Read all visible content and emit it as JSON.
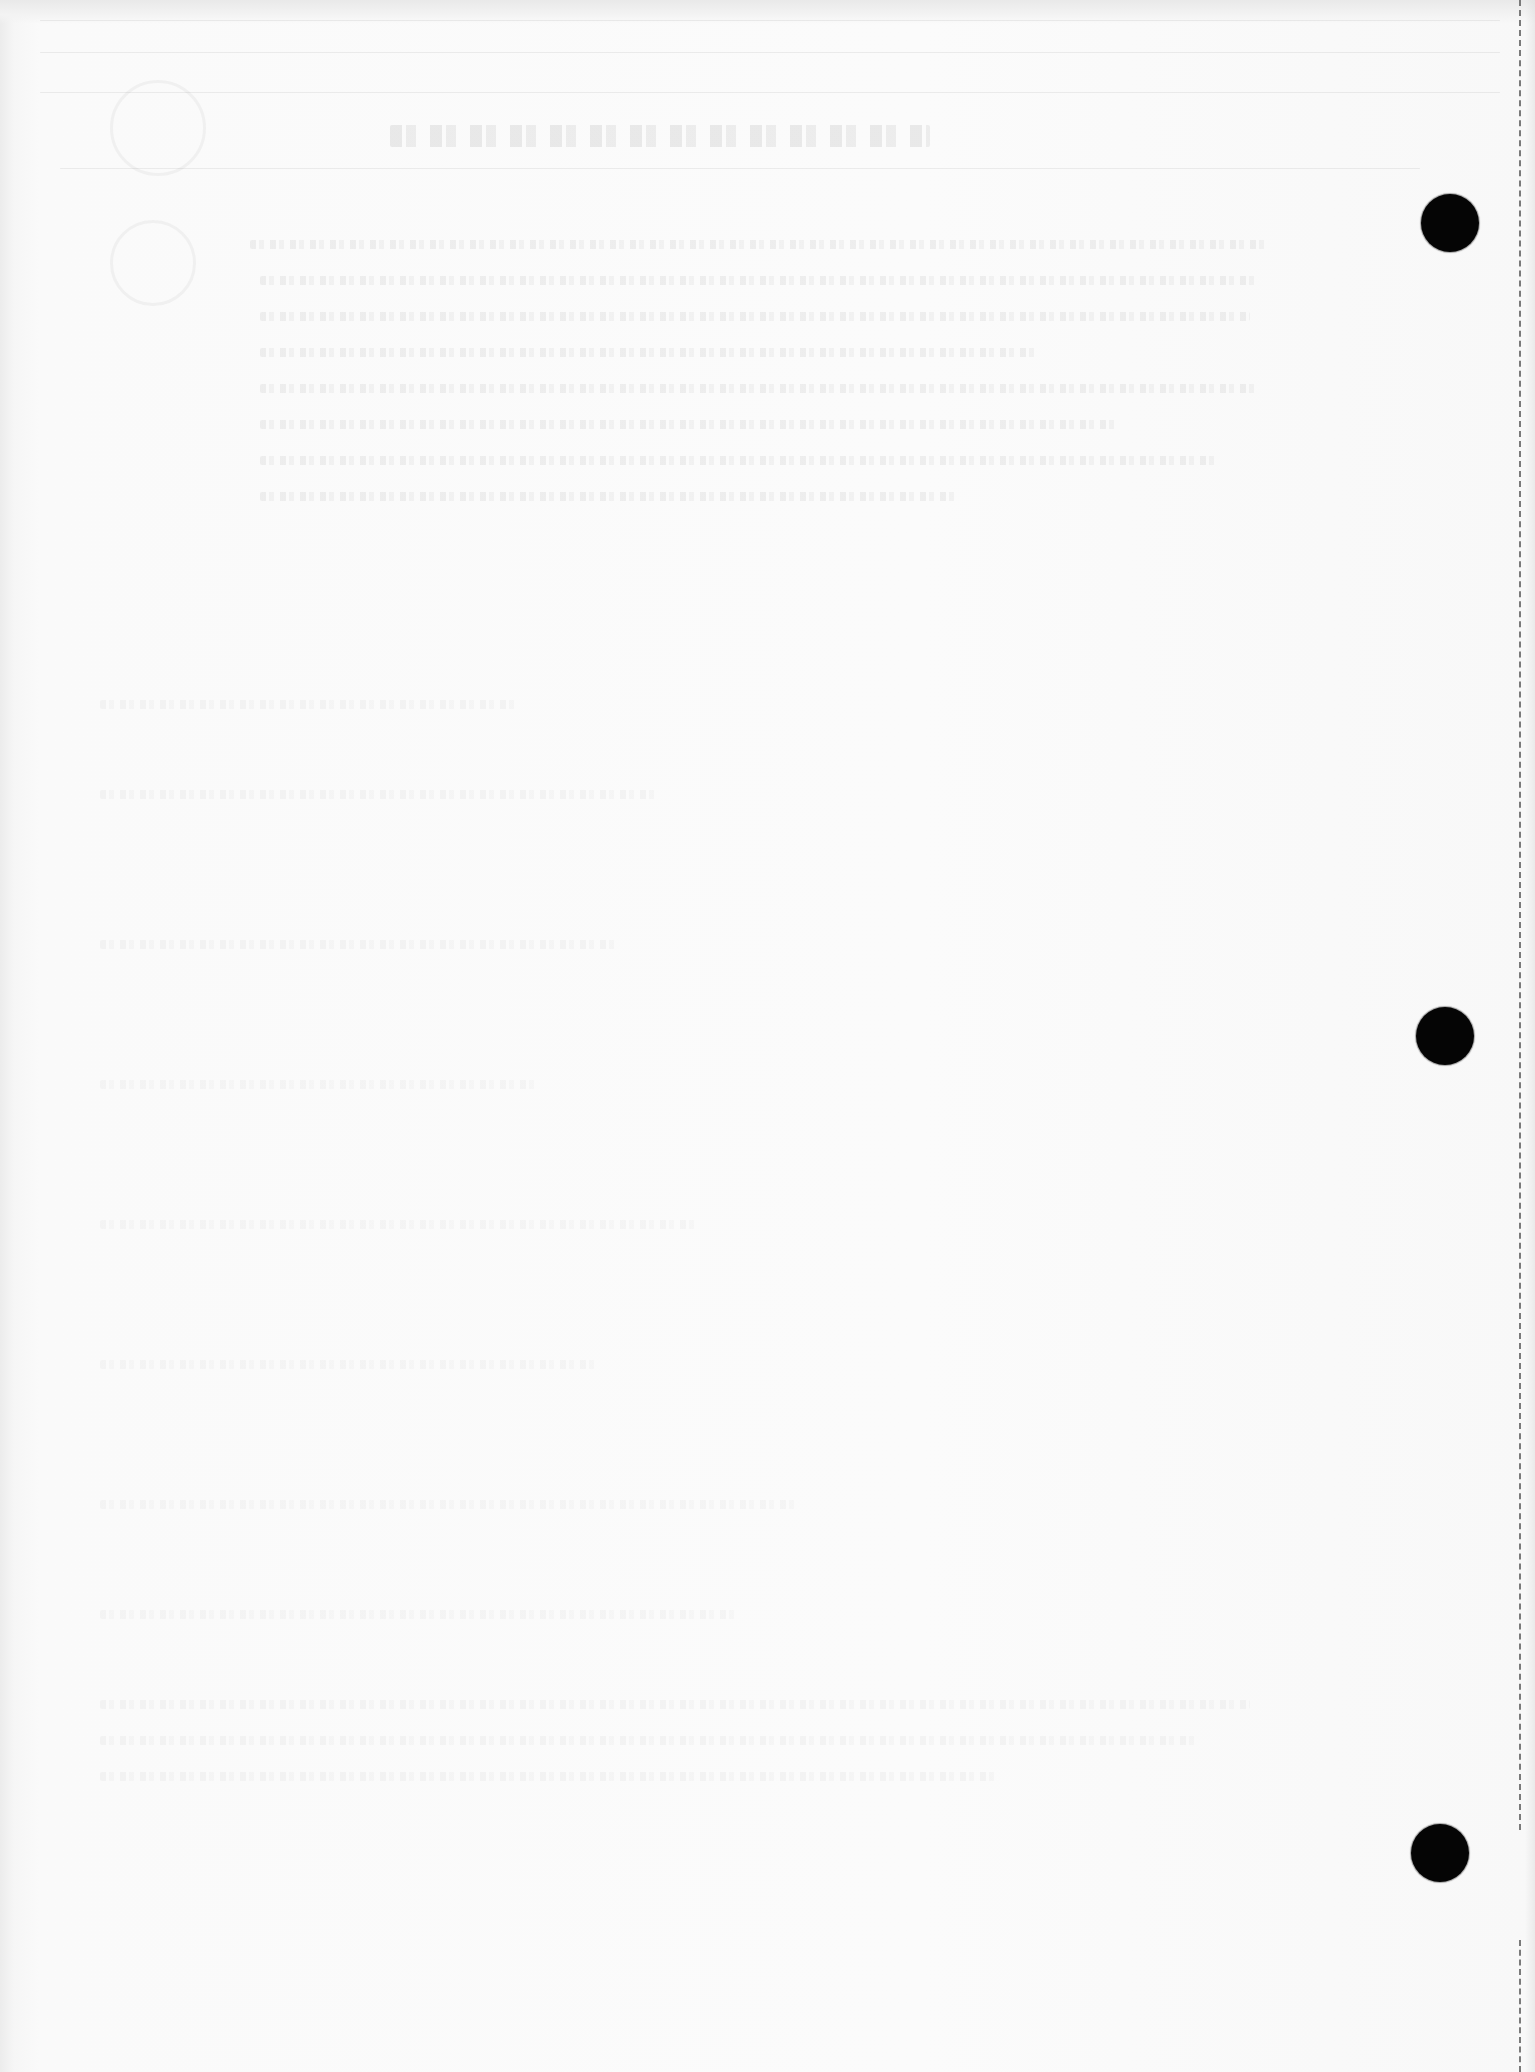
{
  "document": {
    "type": "scanned-page-reverse-side",
    "background_color": "#fbfbfb",
    "content_visibility": "faint illegible bleed-through only"
  },
  "punch_holes": [
    {
      "cx": 1450,
      "cy": 223,
      "diameter": 58
    },
    {
      "cx": 1445,
      "cy": 1036,
      "diameter": 58
    },
    {
      "cx": 1440,
      "cy": 1853,
      "diameter": 58
    }
  ],
  "perforation": {
    "x": 1520,
    "segments": [
      {
        "top": 0,
        "height": 1830
      },
      {
        "top": 1940,
        "height": 132
      }
    ],
    "color": "#7a7a7a"
  },
  "colors": {
    "hole": "#050505",
    "paper": "#fbfbfb",
    "bleed_text": "#787878"
  }
}
